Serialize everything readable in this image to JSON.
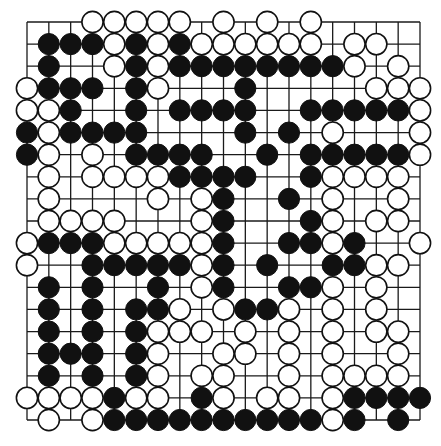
{
  "game": {
    "type": "go",
    "board_size": 19,
    "legend": {
      "B": "black stone",
      "W": "white stone",
      ".": "empty intersection"
    },
    "colors": {
      "black": "#111111",
      "white": "#ffffff",
      "line": "#1a1a1a",
      "background": "#ffffff"
    },
    "rows": [
      "...WWWWW.W.W.W.....",
      ".BBBWBWBWWWWWW.WW..",
      ".B..WBWBBBBBBBBW.W.",
      "WBBB.BW...B.....WWW",
      "WWB..B.BBBB..BBBBBW",
      "BWBBBB....B.B.W...W",
      "BW.W.BBBB..B.BBBBBW",
      ".W.WWWWBBBB..BWWWW.",
      ".W....W.WB..B.W..W.",
      ".WWWW...WB...BW.WW.",
      "WBBBWWWWWB..BBWB..W",
      "W..BBBBBWB.B..BBWW.",
      ".B.B..B.WB..BBW.W..",
      ".B.B.BBW.WBBW.W.W..",
      ".B.B.BWWW.W.W.W.WW.",
      ".BBB.BW..WW.W.W..W.",
      ".B.B.BW.WW..W.WWWW.",
      "WWWWBWW.BW.WW.WBBBB",
      ".W.WBBBBBBBBBBWB.B."
    ]
  }
}
